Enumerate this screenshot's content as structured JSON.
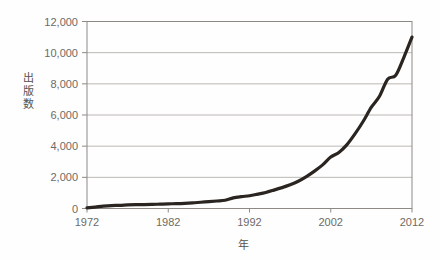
{
  "chart_data": {
    "type": "line",
    "title": "",
    "subtitle": "",
    "xlabel": "年",
    "ylabel": "出版数",
    "xlim": [
      1972,
      2012
    ],
    "ylim": [
      0,
      12000
    ],
    "grid": true,
    "grid_axis": "y",
    "legend": false,
    "legend_position": "none",
    "line_color": "#2b2521",
    "line_width": 3.2,
    "axis_color": "#8d8a85",
    "grid_color": "#b3b0ab",
    "x_ticks": [
      1972,
      1982,
      1992,
      2002,
      2012
    ],
    "x_tick_labels": [
      "1972",
      "1982",
      "1992",
      "2002",
      "2012"
    ],
    "y_ticks": [
      0,
      2000,
      4000,
      6000,
      8000,
      10000,
      12000
    ],
    "y_tick_labels": [
      "0",
      "2,000",
      "4,000",
      "6,000",
      "8,000",
      "10,000",
      "12,000"
    ],
    "x": [
      1972,
      1973,
      1974,
      1975,
      1976,
      1977,
      1978,
      1979,
      1980,
      1981,
      1982,
      1983,
      1984,
      1985,
      1986,
      1987,
      1988,
      1989,
      1990,
      1991,
      1992,
      1993,
      1994,
      1995,
      1996,
      1997,
      1998,
      1999,
      2000,
      2001,
      2002,
      2003,
      2004,
      2005,
      2006,
      2007,
      2008,
      2009,
      2010,
      2011,
      2012
    ],
    "values": [
      40,
      90,
      150,
      190,
      200,
      230,
      250,
      250,
      260,
      280,
      300,
      310,
      330,
      360,
      400,
      440,
      480,
      530,
      680,
      760,
      820,
      920,
      1030,
      1180,
      1340,
      1520,
      1750,
      2050,
      2400,
      2800,
      3300,
      3600,
      4100,
      4800,
      5600,
      6500,
      7200,
      8300,
      8550,
      9700,
      11000
    ],
    "series": [
      {
        "name": "出版数",
        "values": [
          40,
          90,
          150,
          190,
          200,
          230,
          250,
          250,
          260,
          280,
          300,
          310,
          330,
          360,
          400,
          440,
          480,
          530,
          680,
          760,
          820,
          920,
          1030,
          1180,
          1340,
          1520,
          1750,
          2050,
          2400,
          2800,
          3300,
          3600,
          4100,
          4800,
          5600,
          6500,
          7200,
          8300,
          8550,
          9700,
          11000
        ]
      }
    ],
    "annotations": []
  },
  "axes": {
    "y_axis_title": "出版数",
    "x_axis_title": "年"
  }
}
